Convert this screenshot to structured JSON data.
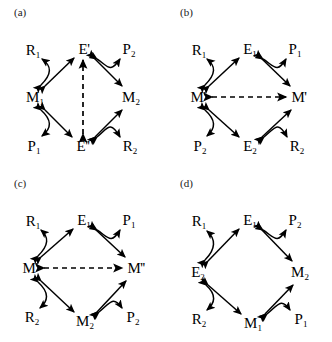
{
  "figure": {
    "type": "diagram",
    "width": 332,
    "height": 342,
    "background_color": "#ffffff",
    "line_color": "#000000"
  },
  "panels": [
    {
      "id": "a",
      "label": "(a)",
      "nodes": [
        {
          "name": "R1",
          "text": "R",
          "sub": "1",
          "prime": "",
          "x": 33,
          "y": 50
        },
        {
          "name": "E-prime",
          "text": "E",
          "sub": "",
          "prime": "'",
          "x": 84,
          "y": 49
        },
        {
          "name": "P2",
          "text": "P",
          "sub": "2",
          "prime": "",
          "x": 129,
          "y": 49
        },
        {
          "name": "M1",
          "text": "M",
          "sub": "1",
          "prime": "",
          "x": 35,
          "y": 97
        },
        {
          "name": "M2",
          "text": "M",
          "sub": "2",
          "prime": "",
          "x": 131,
          "y": 97
        },
        {
          "name": "P1",
          "text": "P",
          "sub": "1",
          "prime": "",
          "x": 34,
          "y": 146
        },
        {
          "name": "E-doubleprime",
          "text": "E",
          "sub": "",
          "prime": "''",
          "x": 83,
          "y": 146
        },
        {
          "name": "R2",
          "text": "R",
          "sub": "2",
          "prime": "",
          "x": 130,
          "y": 146
        }
      ],
      "edges": [
        {
          "from": "M1",
          "to": "E-prime",
          "style": "solid",
          "shape": "straight"
        },
        {
          "from": "M1",
          "to": "R1",
          "style": "solid",
          "shape": "curved"
        },
        {
          "from": "E-prime",
          "to": "M2",
          "style": "solid",
          "shape": "straight"
        },
        {
          "from": "E-prime",
          "to": "P2",
          "style": "solid",
          "shape": "curved"
        },
        {
          "from": "M1",
          "to": "E-doubleprime",
          "style": "solid",
          "shape": "straight"
        },
        {
          "from": "M1",
          "to": "P1",
          "style": "solid",
          "shape": "curved"
        },
        {
          "from": "E-doubleprime",
          "to": "M2",
          "style": "solid",
          "shape": "straight"
        },
        {
          "from": "E-doubleprime",
          "to": "R2",
          "style": "solid",
          "shape": "curved"
        },
        {
          "from": "E-doubleprime",
          "to": "E-prime",
          "style": "dashed",
          "shape": "straight"
        }
      ]
    },
    {
      "id": "b",
      "label": "(b)",
      "nodes": [
        {
          "name": "R1",
          "text": "R",
          "sub": "1",
          "prime": "",
          "x": 33,
          "y": 50
        },
        {
          "name": "E1",
          "text": "E",
          "sub": "1",
          "prime": "",
          "x": 84,
          "y": 49
        },
        {
          "name": "P1",
          "text": "P",
          "sub": "1",
          "prime": "",
          "x": 129,
          "y": 49
        },
        {
          "name": "M-prime-left",
          "text": "M",
          "sub": "",
          "prime": "'",
          "x": 32,
          "y": 97
        },
        {
          "name": "M-prime-right",
          "text": "M",
          "sub": "",
          "prime": "'",
          "x": 133,
          "y": 97
        },
        {
          "name": "P2",
          "text": "P",
          "sub": "2",
          "prime": "",
          "x": 34,
          "y": 146
        },
        {
          "name": "E2",
          "text": "E",
          "sub": "2",
          "prime": "",
          "x": 84,
          "y": 146
        },
        {
          "name": "R2",
          "text": "R",
          "sub": "2",
          "prime": "",
          "x": 131,
          "y": 146
        }
      ],
      "edges": [
        {
          "from": "M-prime-left",
          "to": "E1",
          "style": "solid",
          "shape": "straight"
        },
        {
          "from": "M-prime-left",
          "to": "R1",
          "style": "solid",
          "shape": "curved"
        },
        {
          "from": "E1",
          "to": "M-prime-right",
          "style": "solid",
          "shape": "straight"
        },
        {
          "from": "E1",
          "to": "P1",
          "style": "solid",
          "shape": "curved"
        },
        {
          "from": "M-prime-left",
          "to": "E2",
          "style": "solid",
          "shape": "straight"
        },
        {
          "from": "M-prime-left",
          "to": "P2",
          "style": "solid",
          "shape": "curved"
        },
        {
          "from": "E2",
          "to": "M-prime-right",
          "style": "solid",
          "shape": "straight"
        },
        {
          "from": "E2",
          "to": "R2",
          "style": "solid",
          "shape": "curved"
        },
        {
          "from": "M-prime-left",
          "to": "M-prime-right",
          "style": "dashed",
          "shape": "horizontal"
        }
      ]
    },
    {
      "id": "c",
      "label": "(c)",
      "nodes": [
        {
          "name": "R1",
          "text": "R",
          "sub": "1",
          "prime": "",
          "x": 33,
          "y": 50
        },
        {
          "name": "E1",
          "text": "E",
          "sub": "1",
          "prime": "",
          "x": 84,
          "y": 49
        },
        {
          "name": "P1",
          "text": "P",
          "sub": "1",
          "prime": "",
          "x": 129,
          "y": 49
        },
        {
          "name": "M-prime",
          "text": "M",
          "sub": "",
          "prime": "'",
          "x": 30,
          "y": 97
        },
        {
          "name": "M-doubleprime",
          "text": "M",
          "sub": "",
          "prime": "''",
          "x": 135,
          "y": 97
        },
        {
          "name": "R2",
          "text": "R",
          "sub": "2",
          "prime": "",
          "x": 32,
          "y": 146
        },
        {
          "name": "M2",
          "text": "M",
          "sub": "2",
          "prime": "",
          "x": 85,
          "y": 150
        },
        {
          "name": "P2",
          "text": "P",
          "sub": "2",
          "prime": "",
          "x": 133,
          "y": 146
        }
      ],
      "edges": [
        {
          "from": "M-prime",
          "to": "E1",
          "style": "solid",
          "shape": "straight"
        },
        {
          "from": "M-prime",
          "to": "R1",
          "style": "solid",
          "shape": "curved"
        },
        {
          "from": "E1",
          "to": "M-doubleprime",
          "style": "solid",
          "shape": "straight"
        },
        {
          "from": "E1",
          "to": "P1",
          "style": "solid",
          "shape": "curved"
        },
        {
          "from": "M-prime",
          "to": "M2",
          "style": "solid",
          "shape": "straight"
        },
        {
          "from": "M-prime",
          "to": "R2",
          "style": "solid",
          "shape": "curved"
        },
        {
          "from": "M2",
          "to": "M-doubleprime",
          "style": "solid",
          "shape": "straight"
        },
        {
          "from": "M2",
          "to": "P2",
          "style": "solid",
          "shape": "curved"
        },
        {
          "from": "M-prime",
          "to": "M-doubleprime",
          "style": "dashed",
          "shape": "horizontal"
        }
      ]
    },
    {
      "id": "d",
      "label": "(d)",
      "nodes": [
        {
          "name": "R1",
          "text": "R",
          "sub": "1",
          "prime": "",
          "x": 33,
          "y": 50
        },
        {
          "name": "E1",
          "text": "E",
          "sub": "1",
          "prime": "",
          "x": 84,
          "y": 49
        },
        {
          "name": "P2",
          "text": "P",
          "sub": "2",
          "prime": "",
          "x": 129,
          "y": 49
        },
        {
          "name": "E2",
          "text": "E",
          "sub": "2",
          "prime": "",
          "x": 32,
          "y": 101
        },
        {
          "name": "M2",
          "text": "M",
          "sub": "2",
          "prime": "",
          "x": 134,
          "y": 101
        },
        {
          "name": "R2",
          "text": "R",
          "sub": "2",
          "prime": "",
          "x": 33,
          "y": 148
        },
        {
          "name": "M1",
          "text": "M",
          "sub": "1",
          "prime": "",
          "x": 87,
          "y": 152
        },
        {
          "name": "P1",
          "text": "P",
          "sub": "1",
          "prime": "",
          "x": 135,
          "y": 148
        }
      ],
      "edges": [
        {
          "from": "E2",
          "to": "E1",
          "style": "solid",
          "shape": "straight"
        },
        {
          "from": "E2",
          "to": "R1",
          "style": "solid",
          "shape": "curved"
        },
        {
          "from": "E1",
          "to": "M2",
          "style": "solid",
          "shape": "straight"
        },
        {
          "from": "E1",
          "to": "P2",
          "style": "solid",
          "shape": "curved"
        },
        {
          "from": "E2",
          "to": "M1",
          "style": "solid",
          "shape": "straight"
        },
        {
          "from": "E2",
          "to": "R2",
          "style": "solid",
          "shape": "curved"
        },
        {
          "from": "M1",
          "to": "M2",
          "style": "solid",
          "shape": "straight"
        },
        {
          "from": "M1",
          "to": "P1",
          "style": "solid",
          "shape": "curved"
        }
      ]
    }
  ]
}
